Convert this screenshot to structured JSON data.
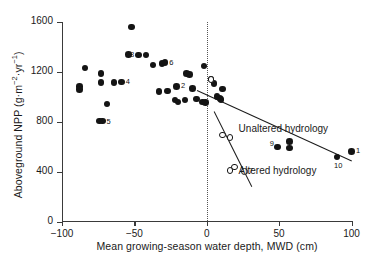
{
  "chart_data": {
    "type": "scatter",
    "title": "",
    "xlabel": "Mean growing-season water depth, MWD (cm)",
    "ylabel": "Aboveground NPP (g·m−2·yr−1)",
    "ylabel_parts": {
      "pre": "Aboveground NPP (g·m",
      "sup1": "−2",
      "mid": "·yr",
      "sup2": "−1",
      "post": ")"
    },
    "xlim": [
      -100,
      100
    ],
    "ylim": [
      0,
      1600
    ],
    "xticks": [
      -100,
      -50,
      0,
      50,
      100
    ],
    "xticklabels": [
      "−100",
      "−50",
      "0",
      "50",
      "100"
    ],
    "yticks": [
      0,
      400,
      800,
      1200,
      1600
    ],
    "yticklabels": [
      "0",
      "400",
      "800",
      "1200",
      "1600"
    ],
    "grid": false,
    "legend": "none",
    "reference_line": {
      "type": "vertical-dotted",
      "x": 0
    },
    "series": [
      {
        "name": "Unaltered hydrology",
        "marker": "filled-circle",
        "points": [
          {
            "x": -84,
            "y": 1232
          },
          {
            "x": -88,
            "y": 1085
          },
          {
            "x": -88,
            "y": 1060
          },
          {
            "x": -73,
            "y": 1190
          },
          {
            "x": -73,
            "y": 1115
          },
          {
            "x": -64,
            "y": 1115
          },
          {
            "x": -69,
            "y": 945
          },
          {
            "x": -74,
            "y": 810,
            "label": "5"
          },
          {
            "x": -72,
            "y": 808
          },
          {
            "x": -54,
            "y": 1340
          },
          {
            "x": -52,
            "y": 1560
          },
          {
            "x": -47,
            "y": 1335
          },
          {
            "x": -42,
            "y": 1335
          },
          {
            "x": -59,
            "y": 1120,
            "label": "4"
          },
          {
            "x": -37,
            "y": 1255
          },
          {
            "x": -31,
            "y": 1268
          },
          {
            "x": -29,
            "y": 1275,
            "label": "6"
          },
          {
            "x": -33,
            "y": 1045
          },
          {
            "x": -27,
            "y": 1050
          },
          {
            "x": -21,
            "y": 1085,
            "label": "2"
          },
          {
            "x": -22,
            "y": 975
          },
          {
            "x": -20,
            "y": 960
          },
          {
            "x": -15,
            "y": 975
          },
          {
            "x": -14,
            "y": 1190
          },
          {
            "x": -12,
            "y": 1180
          },
          {
            "x": -10,
            "y": 1070
          },
          {
            "x": -7,
            "y": 985
          },
          {
            "x": -3,
            "y": 960
          },
          {
            "x": -2,
            "y": 1250
          },
          {
            "x": -1,
            "y": 955
          },
          {
            "x": 3,
            "y": 1145
          },
          {
            "x": 5,
            "y": 1110
          },
          {
            "x": 7,
            "y": 1005
          },
          {
            "x": 9,
            "y": 990
          },
          {
            "x": 10,
            "y": 980
          },
          {
            "x": 11,
            "y": 1065
          },
          {
            "x": 49,
            "y": 600,
            "label": "9"
          },
          {
            "x": 57,
            "y": 645
          },
          {
            "x": 57,
            "y": 590
          },
          {
            "x": 90,
            "y": 520,
            "label": "10"
          },
          {
            "x": 100,
            "y": 565,
            "label": "1"
          }
        ]
      },
      {
        "name": "Altered hydrology",
        "marker": "open-circle",
        "points": [
          {
            "x": 3,
            "y": 1140
          },
          {
            "x": 11,
            "y": 695
          },
          {
            "x": 16,
            "y": 675
          },
          {
            "x": 19,
            "y": 440
          },
          {
            "x": 16,
            "y": 412
          },
          {
            "x": 26,
            "y": 405,
            "label": "7"
          }
        ]
      }
    ],
    "trendlines": [
      {
        "name": "Unaltered hydrology",
        "x1": -7,
        "y1": 1060,
        "x2": 100,
        "y2": 495
      },
      {
        "name": "Altered hydrology",
        "x1": 5,
        "y1": 890,
        "x2": 31,
        "y2": 290
      }
    ],
    "annotations": [
      {
        "text": "Unaltered hydrology",
        "x": 22,
        "y": 740
      },
      {
        "text": "Altered hydrology",
        "x": 22,
        "y": 400
      }
    ],
    "point_labels": [
      "1",
      "2",
      "4",
      "5",
      "6",
      "7",
      "8",
      "9",
      "10"
    ],
    "extra_labels": [
      {
        "text": "8",
        "x": -53,
        "y": 1380
      }
    ]
  },
  "colors": {
    "marker": "#141414",
    "axis": "#3a3a3a",
    "text": "#1a1a1a",
    "background": "#ffffff"
  }
}
